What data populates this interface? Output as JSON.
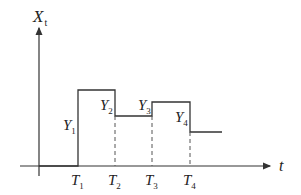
{
  "diagram": {
    "y_axis_label": "X",
    "y_axis_sub": "t",
    "x_axis_label": "t",
    "time_marks": [
      {
        "label": "T",
        "sub": "1"
      },
      {
        "label": "T",
        "sub": "2"
      },
      {
        "label": "T",
        "sub": "3"
      },
      {
        "label": "T",
        "sub": "4"
      }
    ],
    "levels": [
      {
        "label": "Y",
        "sub": "1"
      },
      {
        "label": "Y",
        "sub": "2"
      },
      {
        "label": "Y",
        "sub": "3"
      },
      {
        "label": "Y",
        "sub": "4"
      }
    ],
    "line_color": "#333333",
    "dash_color": "#555555"
  }
}
